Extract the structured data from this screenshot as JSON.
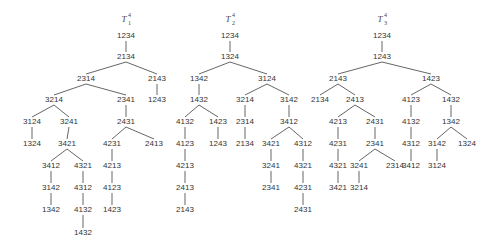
{
  "figure": {
    "trees": [
      {
        "id": "T1",
        "title": {
          "letter": "T",
          "subscript": "1",
          "superscript": "4"
        },
        "nodes": [
          {
            "id": "a1",
            "label": "1234",
            "x": 126,
            "y": 36
          },
          {
            "id": "a2",
            "label": "2134",
            "x": 126,
            "y": 57
          },
          {
            "id": "a3",
            "label": "2314",
            "x": 86,
            "y": 79
          },
          {
            "id": "a4",
            "label": "2143",
            "x": 157,
            "y": 79
          },
          {
            "id": "a5",
            "label": "3214",
            "x": 54,
            "y": 100
          },
          {
            "id": "a6",
            "label": "2341",
            "x": 126,
            "y": 100
          },
          {
            "id": "a7",
            "label": "1243",
            "x": 157,
            "y": 100
          },
          {
            "id": "a8",
            "label": "3124",
            "x": 32,
            "y": 122
          },
          {
            "id": "a9",
            "label": "3241",
            "x": 69,
            "y": 122
          },
          {
            "id": "a10",
            "label": "2431",
            "x": 126,
            "y": 122
          },
          {
            "id": "a11",
            "label": "1324",
            "x": 32,
            "y": 144
          },
          {
            "id": "a12",
            "label": "3421",
            "x": 67,
            "y": 144
          },
          {
            "id": "a13",
            "label": "4231",
            "x": 112,
            "y": 144
          },
          {
            "id": "a14",
            "label": "2413",
            "x": 154,
            "y": 144
          },
          {
            "id": "a15",
            "label": "3412",
            "x": 51,
            "y": 166
          },
          {
            "id": "a16",
            "label": "4321",
            "x": 83,
            "y": 166
          },
          {
            "id": "a17",
            "label": "4213",
            "x": 112,
            "y": 166
          },
          {
            "id": "a18",
            "label": "3142",
            "x": 51,
            "y": 188
          },
          {
            "id": "a19",
            "label": "4312",
            "x": 83,
            "y": 188
          },
          {
            "id": "a20",
            "label": "4123",
            "x": 112,
            "y": 188
          },
          {
            "id": "a21",
            "label": "1342",
            "x": 51,
            "y": 210
          },
          {
            "id": "a22",
            "label": "4132",
            "x": 83,
            "y": 210
          },
          {
            "id": "a23",
            "label": "1423",
            "x": 112,
            "y": 210
          },
          {
            "id": "a24",
            "label": "1432",
            "x": 83,
            "y": 233
          }
        ],
        "edges": [
          [
            "a1",
            "a2"
          ],
          [
            "a2",
            "a3"
          ],
          [
            "a2",
            "a4"
          ],
          [
            "a3",
            "a5"
          ],
          [
            "a3",
            "a6"
          ],
          [
            "a4",
            "a7"
          ],
          [
            "a5",
            "a8"
          ],
          [
            "a5",
            "a9"
          ],
          [
            "a6",
            "a10"
          ],
          [
            "a8",
            "a11"
          ],
          [
            "a9",
            "a12"
          ],
          [
            "a10",
            "a13"
          ],
          [
            "a10",
            "a14"
          ],
          [
            "a12",
            "a15"
          ],
          [
            "a12",
            "a16"
          ],
          [
            "a13",
            "a17"
          ],
          [
            "a15",
            "a18"
          ],
          [
            "a16",
            "a19"
          ],
          [
            "a17",
            "a20"
          ],
          [
            "a18",
            "a21"
          ],
          [
            "a19",
            "a22"
          ],
          [
            "a20",
            "a23"
          ],
          [
            "a22",
            "a24"
          ]
        ],
        "title_pos": {
          "x": 126,
          "y": 19
        }
      },
      {
        "id": "T2",
        "title": {
          "letter": "T",
          "subscript": "2",
          "superscript": "4"
        },
        "nodes": [
          {
            "id": "b1",
            "label": "1234",
            "x": 230,
            "y": 36
          },
          {
            "id": "b2",
            "label": "1324",
            "x": 230,
            "y": 57
          },
          {
            "id": "b3",
            "label": "1342",
            "x": 199,
            "y": 79
          },
          {
            "id": "b4",
            "label": "3124",
            "x": 267,
            "y": 79
          },
          {
            "id": "b5",
            "label": "1432",
            "x": 199,
            "y": 100
          },
          {
            "id": "b6",
            "label": "3214",
            "x": 245,
            "y": 100
          },
          {
            "id": "b7",
            "label": "3142",
            "x": 289,
            "y": 100
          },
          {
            "id": "b8",
            "label": "4132",
            "x": 185,
            "y": 122
          },
          {
            "id": "b9",
            "label": "1423",
            "x": 218,
            "y": 122
          },
          {
            "id": "b10",
            "label": "2314",
            "x": 245,
            "y": 122
          },
          {
            "id": "b11",
            "label": "3412",
            "x": 289,
            "y": 122
          },
          {
            "id": "b12",
            "label": "4123",
            "x": 185,
            "y": 144
          },
          {
            "id": "b13",
            "label": "1243",
            "x": 218,
            "y": 144
          },
          {
            "id": "b14",
            "label": "2134",
            "x": 245,
            "y": 144
          },
          {
            "id": "b15",
            "label": "3421",
            "x": 271,
            "y": 144
          },
          {
            "id": "b16",
            "label": "4312",
            "x": 303,
            "y": 144
          },
          {
            "id": "b17",
            "label": "4213",
            "x": 185,
            "y": 166
          },
          {
            "id": "b18",
            "label": "3241",
            "x": 271,
            "y": 166
          },
          {
            "id": "b19",
            "label": "4321",
            "x": 303,
            "y": 166
          },
          {
            "id": "b20",
            "label": "2413",
            "x": 185,
            "y": 188
          },
          {
            "id": "b21",
            "label": "2341",
            "x": 271,
            "y": 188
          },
          {
            "id": "b22",
            "label": "4231",
            "x": 303,
            "y": 188
          },
          {
            "id": "b23",
            "label": "2143",
            "x": 185,
            "y": 210
          },
          {
            "id": "b24",
            "label": "2431",
            "x": 303,
            "y": 210
          }
        ],
        "edges": [
          [
            "b1",
            "b2"
          ],
          [
            "b2",
            "b3"
          ],
          [
            "b2",
            "b4"
          ],
          [
            "b3",
            "b5"
          ],
          [
            "b4",
            "b6"
          ],
          [
            "b4",
            "b7"
          ],
          [
            "b5",
            "b8"
          ],
          [
            "b5",
            "b9"
          ],
          [
            "b6",
            "b10"
          ],
          [
            "b7",
            "b11"
          ],
          [
            "b8",
            "b12"
          ],
          [
            "b9",
            "b13"
          ],
          [
            "b10",
            "b14"
          ],
          [
            "b11",
            "b15"
          ],
          [
            "b11",
            "b16"
          ],
          [
            "b12",
            "b17"
          ],
          [
            "b15",
            "b18"
          ],
          [
            "b16",
            "b19"
          ],
          [
            "b17",
            "b20"
          ],
          [
            "b18",
            "b21"
          ],
          [
            "b19",
            "b22"
          ],
          [
            "b20",
            "b23"
          ],
          [
            "b22",
            "b24"
          ]
        ],
        "title_pos": {
          "x": 230,
          "y": 19
        }
      },
      {
        "id": "T3",
        "title": {
          "letter": "T",
          "subscript": "3",
          "superscript": "4"
        },
        "nodes": [
          {
            "id": "c1",
            "label": "1234",
            "x": 382,
            "y": 36
          },
          {
            "id": "c2",
            "label": "1243",
            "x": 382,
            "y": 57
          },
          {
            "id": "c3",
            "label": "2143",
            "x": 338,
            "y": 79
          },
          {
            "id": "c4",
            "label": "1423",
            "x": 431,
            "y": 79
          },
          {
            "id": "c5",
            "label": "2134",
            "x": 320,
            "y": 100
          },
          {
            "id": "c6",
            "label": "2413",
            "x": 355,
            "y": 100
          },
          {
            "id": "c7",
            "label": "4123",
            "x": 411,
            "y": 100
          },
          {
            "id": "c8",
            "label": "1432",
            "x": 451,
            "y": 100
          },
          {
            "id": "c9",
            "label": "4213",
            "x": 338,
            "y": 122
          },
          {
            "id": "c10",
            "label": "2431",
            "x": 375,
            "y": 122
          },
          {
            "id": "c11",
            "label": "4132",
            "x": 411,
            "y": 122
          },
          {
            "id": "c12",
            "label": "1342",
            "x": 451,
            "y": 122
          },
          {
            "id": "c13",
            "label": "4231",
            "x": 338,
            "y": 144
          },
          {
            "id": "c14",
            "label": "2341",
            "x": 375,
            "y": 144
          },
          {
            "id": "c15",
            "label": "4312",
            "x": 411,
            "y": 144
          },
          {
            "id": "c16",
            "label": "3142",
            "x": 437,
            "y": 144
          },
          {
            "id": "c17",
            "label": "1324",
            "x": 467,
            "y": 144
          },
          {
            "id": "c18",
            "label": "4321",
            "x": 338,
            "y": 166
          },
          {
            "id": "c19",
            "label": "3241",
            "x": 359,
            "y": 166
          },
          {
            "id": "c20",
            "label": "2314",
            "x": 395,
            "y": 166
          },
          {
            "id": "c21",
            "label": "3412",
            "x": 411,
            "y": 166
          },
          {
            "id": "c22",
            "label": "3124",
            "x": 437,
            "y": 166
          },
          {
            "id": "c23",
            "label": "3421",
            "x": 338,
            "y": 188
          },
          {
            "id": "c24",
            "label": "3214",
            "x": 359,
            "y": 188
          }
        ],
        "edges": [
          [
            "c1",
            "c2"
          ],
          [
            "c2",
            "c3"
          ],
          [
            "c2",
            "c4"
          ],
          [
            "c3",
            "c5"
          ],
          [
            "c3",
            "c6"
          ],
          [
            "c4",
            "c7"
          ],
          [
            "c4",
            "c8"
          ],
          [
            "c6",
            "c9"
          ],
          [
            "c6",
            "c10"
          ],
          [
            "c7",
            "c11"
          ],
          [
            "c8",
            "c12"
          ],
          [
            "c9",
            "c13"
          ],
          [
            "c10",
            "c14"
          ],
          [
            "c11",
            "c15"
          ],
          [
            "c12",
            "c16"
          ],
          [
            "c12",
            "c17"
          ],
          [
            "c13",
            "c18"
          ],
          [
            "c14",
            "c19"
          ],
          [
            "c14",
            "c20"
          ],
          [
            "c15",
            "c21"
          ],
          [
            "c16",
            "c22"
          ],
          [
            "c18",
            "c23"
          ],
          [
            "c19",
            "c24"
          ]
        ],
        "title_pos": {
          "x": 382,
          "y": 19
        }
      }
    ]
  }
}
